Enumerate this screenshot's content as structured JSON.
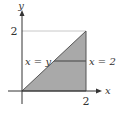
{
  "diagram": {
    "axes": {
      "x_label": "x",
      "y_label": "y",
      "x_tick": "2",
      "y_tick": "2"
    },
    "region": {
      "description": "triangle bounded by y = x, x = 2, and the x-axis",
      "vertices": [
        [
          0,
          0
        ],
        [
          2,
          0
        ],
        [
          2,
          2
        ]
      ],
      "fill_color": "#a9a9a9"
    },
    "annotations": {
      "left_label": "x = y",
      "right_label": "x = 2"
    },
    "colors": {
      "axis": "#333333",
      "guide_line": "#c8c8c8",
      "boundary": "#555555"
    }
  }
}
